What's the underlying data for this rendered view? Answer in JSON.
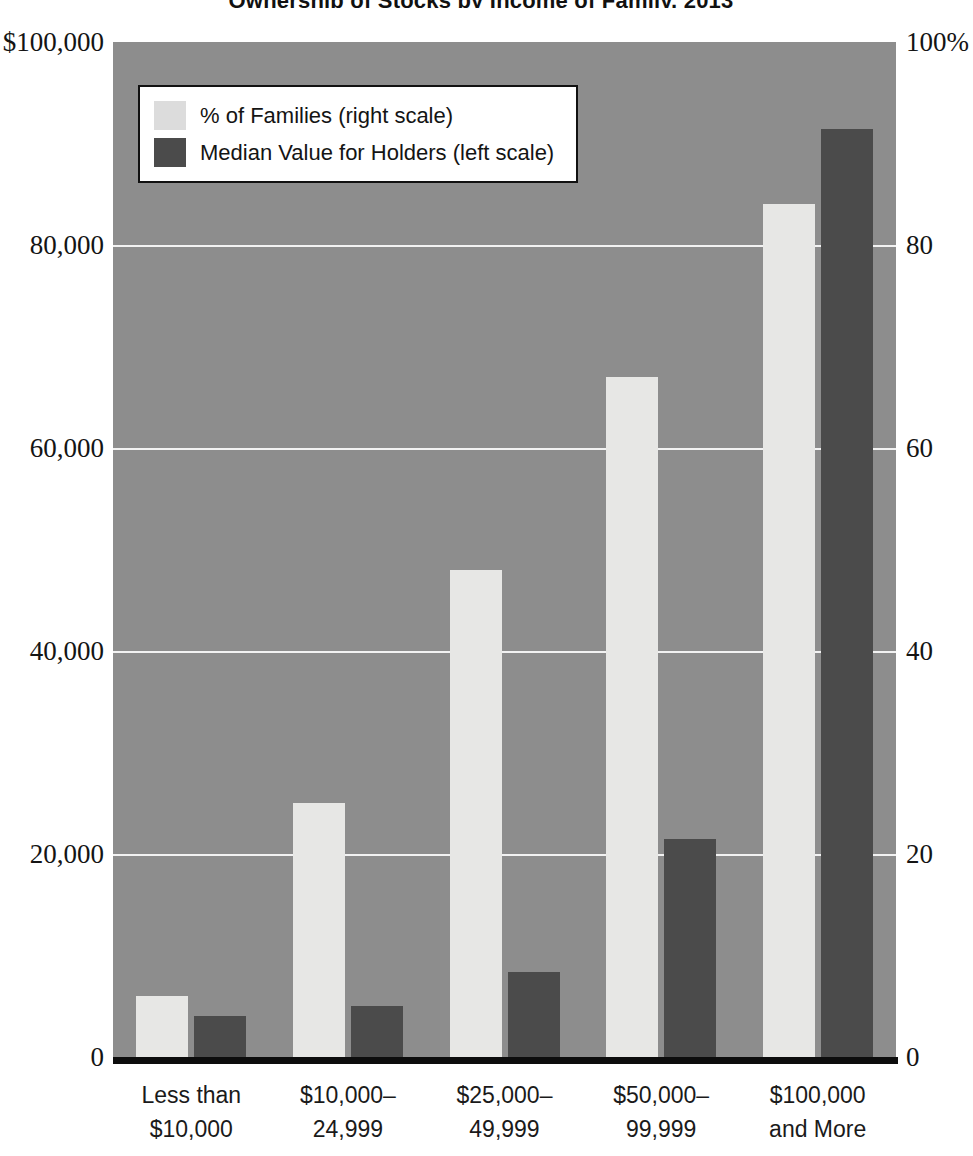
{
  "chart_data": {
    "type": "bar",
    "title": "Ownership of Stocks by Income of Family, 2013",
    "xlabel": "",
    "ylabel": "",
    "categories": [
      "Less than $10,000",
      "$10,000–24,999",
      "$25,000–49,999",
      "$50,000–99,999",
      "$100,000 and More"
    ],
    "category_lines": [
      [
        "Less than",
        "$10,000"
      ],
      [
        "$10,000–",
        "24,999"
      ],
      [
        "$25,000–",
        "49,999"
      ],
      [
        "$50,000–",
        "99,999"
      ],
      [
        "$100,000",
        "and More"
      ]
    ],
    "series": [
      {
        "name": "% of Families (right scale)",
        "axis": "right",
        "color": "#e7e7e5",
        "unit": "%",
        "values": [
          6,
          25,
          48,
          67,
          84
        ]
      },
      {
        "name": "Median Value for Holders (left scale)",
        "axis": "left",
        "color": "#4b4b4b",
        "unit": "$",
        "values": [
          4000,
          5000,
          8400,
          21500,
          91400
        ]
      }
    ],
    "left_axis": {
      "label": "",
      "ylim": [
        0,
        100000
      ],
      "ticks": [
        0,
        20000,
        40000,
        60000,
        80000,
        100000
      ],
      "tick_labels": [
        "0",
        "20,000",
        "40,000",
        "60,000",
        "80,000",
        "$100,000"
      ]
    },
    "right_axis": {
      "label": "",
      "ylim": [
        0,
        100
      ],
      "ticks": [
        0,
        20,
        40,
        60,
        80,
        100
      ],
      "tick_labels": [
        "0",
        "20",
        "40",
        "60",
        "80",
        "100%"
      ]
    },
    "grid": true,
    "legend_position": "top-left",
    "plot_background": "#8d8d8d"
  },
  "legend": {
    "items": [
      {
        "label": "% of Families (right scale)",
        "swatch": "light"
      },
      {
        "label": "Median Value for Holders (left scale)",
        "swatch": "dark"
      }
    ]
  }
}
